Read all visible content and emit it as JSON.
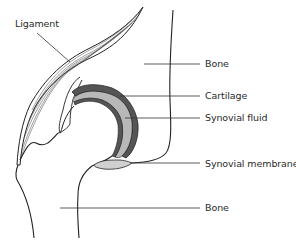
{
  "diagram": {
    "labels": {
      "ligament": "Ligament",
      "bone_top": "Bone",
      "cartilage": "Cartilage",
      "synovial_fluid": "Synovial fluid",
      "synovial_membrane": "Synovial membrane",
      "bone_bottom": "Bone"
    },
    "colors": {
      "outline": "#222222",
      "cartilage_dark": "#555555",
      "synovial_fluid": "#b8b8b8",
      "leader_line": "#333333"
    }
  }
}
